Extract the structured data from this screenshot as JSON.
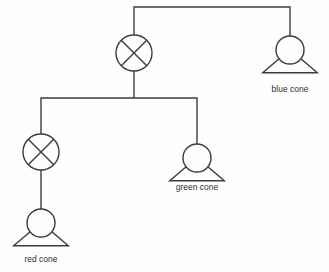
{
  "diagram": {
    "type": "tree",
    "background_color": "#fefefe",
    "line_color": "#3c3c3c",
    "label_color": "#2e2e2e",
    "nodes": [
      {
        "id": "root-mixer",
        "glyph": "crossed-circle",
        "label": "",
        "cx": 134,
        "cy": 53,
        "r": 18
      },
      {
        "id": "blue-cone",
        "glyph": "cone",
        "label": "blue cone",
        "cx": 290,
        "cy": 50,
        "r": 14,
        "label_x": 290,
        "label_y": 90
      },
      {
        "id": "left-mixer",
        "glyph": "crossed-circle",
        "label": "",
        "cx": 41,
        "cy": 152,
        "r": 18
      },
      {
        "id": "green-cone",
        "glyph": "cone",
        "label": "green cone",
        "cx": 197,
        "cy": 158,
        "r": 14,
        "label_x": 197,
        "label_y": 188
      },
      {
        "id": "red-cone",
        "glyph": "cone",
        "label": "red cone",
        "cx": 41,
        "cy": 223,
        "r": 14,
        "label_x": 41,
        "label_y": 260
      }
    ],
    "edges": [
      {
        "id": "edge-root-bar",
        "from": "root-mixer",
        "to": "blue-cone",
        "path": "M 134 35 L 134 7 L 290 7 L 290 36"
      },
      {
        "id": "edge-root-to-level2",
        "from": "root-mixer",
        "to": "level2-bar",
        "path": "M 134 71 L 134 98"
      },
      {
        "id": "edge-level2-bar-left",
        "from": "level2-bar",
        "to": "left-mixer",
        "path": "M 134 98 L 41 98 L 41 134"
      },
      {
        "id": "edge-level2-bar-right",
        "from": "level2-bar",
        "to": "green-cone",
        "path": "M 134 98 L 197 98 L 197 144"
      },
      {
        "id": "edge-left-mixer-to-red",
        "from": "left-mixer",
        "to": "red-cone",
        "path": "M 41 170 L 41 209"
      }
    ]
  }
}
